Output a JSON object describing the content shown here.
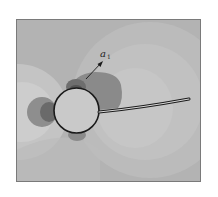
{
  "figure": {
    "label": "a",
    "label_subscript": "1",
    "colors": {
      "page_bg": "#ffffff",
      "field_base": "#b3b3b3",
      "field_light_1": "#bdbdbd",
      "field_light_2": "#c6c6c6",
      "field_light_3": "#cfcfcf",
      "blob_medium": "#8e8e8e",
      "blob_dark": "#6a6a6a",
      "blob_darkest": "#555555",
      "outline": "#1a1a1a",
      "frame": "#7a7a7a"
    },
    "elements": {
      "cylinder": "circle outline",
      "filament": "flexible filament attached to cylinder",
      "arrow": "direction arrow labeled a1"
    }
  }
}
